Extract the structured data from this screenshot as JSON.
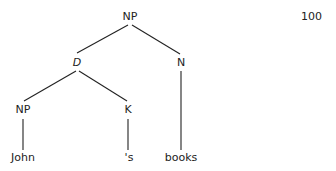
{
  "page_number": "100",
  "tree": {
    "nodes": [
      {
        "id": "root",
        "label": "NP",
        "x": 130,
        "y": 11
      },
      {
        "id": "d",
        "label": "D",
        "x": 77,
        "y": 57,
        "italic": true
      },
      {
        "id": "n",
        "label": "N",
        "x": 181,
        "y": 57
      },
      {
        "id": "np2",
        "label": "NP",
        "x": 23,
        "y": 104
      },
      {
        "id": "k",
        "label": "K",
        "x": 128,
        "y": 104
      },
      {
        "id": "john",
        "label": "John",
        "x": 23,
        "y": 152
      },
      {
        "id": "s",
        "label": "'s",
        "x": 129,
        "y": 152
      },
      {
        "id": "books",
        "label": "books",
        "x": 181,
        "y": 152
      }
    ],
    "edges": [
      [
        "root",
        "d"
      ],
      [
        "root",
        "n"
      ],
      [
        "d",
        "np2"
      ],
      [
        "d",
        "k"
      ],
      [
        "np2",
        "john"
      ],
      [
        "k",
        "s"
      ],
      [
        "n",
        "books"
      ]
    ]
  }
}
